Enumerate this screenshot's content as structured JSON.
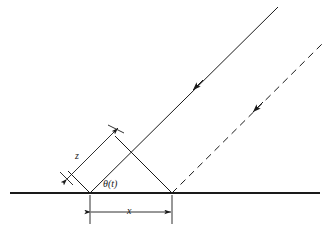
{
  "figure": {
    "type": "line-diagram",
    "title": "",
    "background_color": "#ffffff",
    "stroke_color": "#1a1a1a",
    "width": 331,
    "height": 234
  },
  "labels": {
    "z": "z",
    "x": "x",
    "theta": "θ(t)"
  },
  "geometry": {
    "ground_line": {
      "name": "ground-line",
      "x1": 10,
      "y1": 193,
      "x2": 320,
      "y2": 193,
      "stroke_width": 2.0,
      "style": "solid"
    },
    "left_vertex": {
      "x": 90,
      "y": 193
    },
    "right_vertex": {
      "x": 172,
      "y": 193
    },
    "apex": {
      "x": 115,
      "y": 136
    },
    "left_short_end": {
      "x": 68,
      "y": 171
    },
    "crossing_point": {
      "x": 133,
      "y": 155
    },
    "solid_ray": {
      "name": "solid-ray",
      "x1": 90,
      "y1": 193,
      "x2": 278,
      "y2": 7,
      "style": "solid",
      "arrow_at": {
        "x": 193,
        "y": 90
      },
      "arrow_direction": "down-left"
    },
    "dashed_ray": {
      "name": "dashed-ray",
      "x1": 172,
      "y1": 193,
      "x2": 322,
      "y2": 44,
      "style": "dashed",
      "dash_pattern": "7 5",
      "arrow_at": {
        "x": 253,
        "y": 112
      },
      "arrow_direction": "down-left"
    },
    "apex_to_right_vertex": {
      "name": "apex-right-segment",
      "x1": 115,
      "y1": 136,
      "x2": 172,
      "y2": 193,
      "style": "solid"
    },
    "left_short_segment": {
      "name": "left-short-segment",
      "x1": 90,
      "y1": 193,
      "x2": 68,
      "y2": 171,
      "style": "solid"
    },
    "z_dimension": {
      "name": "z-dimension-line",
      "x1": 66,
      "y1": 178,
      "x2": 121,
      "y2": 124,
      "style": "solid",
      "arrows": "both",
      "tick_lower": {
        "x1": 59,
        "y1": 171,
        "x2": 74,
        "y2": 186
      },
      "tick_upper": {
        "x1": 108,
        "y1": 124,
        "x2": 126,
        "y2": 132
      }
    },
    "x_dimension": {
      "name": "x-dimension-line",
      "x1": 90,
      "y1": 212,
      "x2": 172,
      "y2": 212,
      "style": "solid",
      "arrows": "both",
      "extension_left": {
        "x1": 90,
        "y1": 195,
        "x2": 90,
        "y2": 224
      },
      "extension_right": {
        "x1": 172,
        "y1": 195,
        "x2": 172,
        "y2": 224
      }
    }
  }
}
